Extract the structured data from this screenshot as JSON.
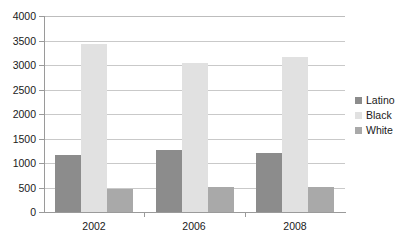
{
  "chart_data": {
    "type": "bar",
    "title": "",
    "xlabel": "",
    "ylabel": "",
    "categories": [
      "2002",
      "2006",
      "2008"
    ],
    "series": [
      {
        "name": "Latino",
        "color": "#8c8c8c",
        "values": [
          1160,
          1260,
          1210
        ]
      },
      {
        "name": "Black",
        "color": "#e1e1e1",
        "values": [
          3430,
          3040,
          3170
        ]
      },
      {
        "name": "White",
        "color": "#a9a9a9",
        "values": [
          470,
          520,
          520
        ]
      }
    ],
    "ylim": [
      0,
      4000
    ],
    "ytick_values": [
      0,
      500,
      1000,
      1500,
      2000,
      2500,
      3000,
      3500,
      4000
    ],
    "ytick_labels": [
      "0",
      "500",
      "1000",
      "1500",
      "2000",
      "2500",
      "3000",
      "3500",
      "4000"
    ],
    "grid": "horizontal",
    "legend_position": "right",
    "axis_color": "#9a9a9a",
    "grid_color": "#c9c9c9",
    "background": "#ffffff"
  }
}
